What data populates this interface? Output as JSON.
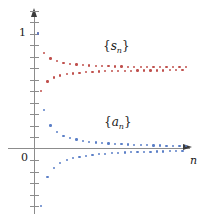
{
  "figure": {
    "title": "",
    "axis": {
      "y_label_top": "1",
      "origin_label": "0",
      "x_axis_name": "n"
    },
    "labels": {
      "series_red_open": "{",
      "series_red_base": "s",
      "series_red_sub": "n",
      "series_red_close": "}",
      "series_blue_open": "{",
      "series_blue_base": "a",
      "series_blue_sub": "n",
      "series_blue_close": "}"
    },
    "colors": {
      "red": "#c0504d",
      "blue": "#5b7fc7",
      "axis": "#8c8c8c",
      "arrow": "#3c3c3c",
      "text": "#1a1a1a",
      "background": "#ffffff"
    }
  },
  "chart_data": {
    "type": "scatter",
    "title": "",
    "xlabel": "n",
    "ylabel": "",
    "xlim": [
      0,
      48
    ],
    "ylim": [
      -0.62,
      1.22
    ],
    "grid": false,
    "legend": "inline-annotations",
    "y_ticks": [
      1,
      0
    ],
    "y_tick_labels": [
      "1",
      "0"
    ],
    "annotations": [
      {
        "text": "{s_n}",
        "x": 24,
        "y": 0.95,
        "color": "#c0504d"
      },
      {
        "text": "{a_n}",
        "x": 24,
        "y": 0.24,
        "color": "#5b7fc7"
      }
    ],
    "series": [
      {
        "name": "{s_n}",
        "color": "#c0504d",
        "description": "partial sums of an alternating series, oscillating and converging to about 0.69",
        "x": [
          1,
          2,
          3,
          4,
          5,
          6,
          7,
          8,
          9,
          10,
          11,
          12,
          13,
          14,
          15,
          16,
          17,
          18,
          19,
          20,
          21,
          22,
          23,
          24,
          25,
          26,
          27,
          28,
          29,
          30,
          31,
          32,
          33,
          34,
          35,
          36,
          37,
          38,
          39,
          40,
          41,
          42,
          43,
          44,
          45,
          46,
          47,
          48
        ],
        "y": [
          1.0,
          0.5,
          0.833,
          0.583,
          0.783,
          0.617,
          0.76,
          0.635,
          0.746,
          0.646,
          0.737,
          0.653,
          0.73,
          0.659,
          0.726,
          0.663,
          0.722,
          0.666,
          0.719,
          0.669,
          0.717,
          0.671,
          0.715,
          0.672,
          0.713,
          0.674,
          0.712,
          0.675,
          0.711,
          0.676,
          0.71,
          0.677,
          0.709,
          0.677,
          0.709,
          0.678,
          0.708,
          0.679,
          0.708,
          0.679,
          0.707,
          0.68,
          0.707,
          0.68,
          0.707,
          0.68,
          0.706,
          0.681
        ]
      },
      {
        "name": "{a_n}",
        "color": "#5b7fc7",
        "description": "alternating terms decreasing in magnitude toward 0",
        "x": [
          1,
          2,
          3,
          4,
          5,
          6,
          7,
          8,
          9,
          10,
          11,
          12,
          13,
          14,
          15,
          16,
          17,
          18,
          19,
          20,
          21,
          22,
          23,
          24,
          25,
          26,
          27,
          28,
          29,
          30,
          31,
          32,
          33,
          34,
          35,
          36,
          37,
          38,
          39,
          40,
          41,
          42,
          43,
          44,
          45,
          46,
          47,
          48
        ],
        "y": [
          1.0,
          -0.5,
          0.333,
          -0.25,
          0.2,
          -0.167,
          0.143,
          -0.125,
          0.111,
          -0.1,
          0.091,
          -0.083,
          0.077,
          -0.071,
          0.067,
          -0.063,
          0.059,
          -0.056,
          0.053,
          -0.05,
          0.048,
          -0.045,
          0.043,
          -0.042,
          0.04,
          -0.038,
          0.037,
          -0.036,
          0.034,
          -0.033,
          0.032,
          -0.031,
          0.03,
          -0.029,
          0.029,
          -0.028,
          0.027,
          -0.026,
          0.026,
          -0.025,
          0.024,
          -0.024,
          0.023,
          -0.023,
          0.022,
          -0.022,
          0.021,
          -0.021
        ]
      }
    ]
  }
}
